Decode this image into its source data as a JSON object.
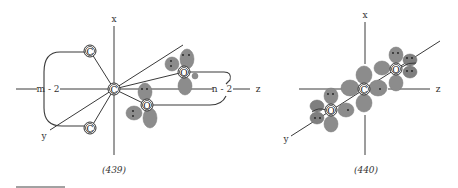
{
  "figure_439": {
    "caption": "(439)",
    "axes": {
      "x_label": "x",
      "y_label": "y"
    },
    "chain_labels": {
      "left": "m - 2",
      "right": "n - 2"
    },
    "atoms": {
      "center": "C",
      "upper_left": "C",
      "lower_left": "C",
      "upper_right": "O",
      "lower_right": "O"
    },
    "z_label": "z"
  },
  "figure_440": {
    "caption": "(440)",
    "axes": {
      "x_label": "x",
      "y_label": "y",
      "z_label": "z"
    },
    "atoms": {
      "center": "C",
      "upper_right": "O",
      "lower_left": "O"
    }
  },
  "footnote_rule": true
}
